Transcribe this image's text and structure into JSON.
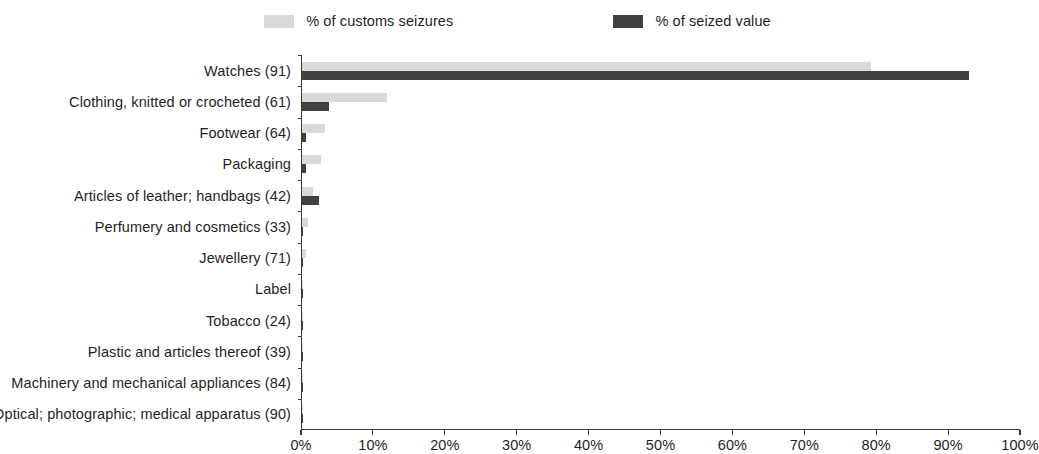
{
  "legend": {
    "entries": [
      {
        "label": "% of customs seizures",
        "color": "#d9d9d9",
        "swatch_name": "legend-swatch-customs-seizures"
      },
      {
        "label": "% of seized value",
        "color": "#414141",
        "swatch_name": "legend-swatch-seized-value"
      }
    ]
  },
  "chart_data": {
    "type": "bar",
    "orientation": "horizontal",
    "title": "",
    "subtitle": "",
    "xlabel": "",
    "ylabel": "",
    "xlim": [
      0,
      100
    ],
    "xtick_labels": [
      "0%",
      "10%",
      "20%",
      "30%",
      "40%",
      "50%",
      "60%",
      "70%",
      "80%",
      "90%",
      "100%"
    ],
    "xtick_values": [
      0,
      10,
      20,
      30,
      40,
      50,
      60,
      70,
      80,
      90,
      100
    ],
    "grid": false,
    "legend_position": "top-center",
    "categories": [
      "Watches (91)",
      "Clothing, knitted or crocheted (61)",
      "Footwear (64)",
      "Packaging",
      "Articles of leather; handbags (42)",
      "Perfumery and cosmetics (33)",
      "Jewellery (71)",
      "Label",
      "Tobacco (24)",
      "Plastic and articles thereof (39)",
      "Machinery and mechanical appliances (84)",
      "Optical; photographic; medical apparatus (90)"
    ],
    "series": [
      {
        "name": "% of customs seizures",
        "color": "#d9d9d9",
        "values": [
          79.2,
          11.8,
          3.2,
          2.6,
          1.5,
          0.9,
          0.6,
          0.2,
          0.2,
          0.2,
          0.1,
          0.1
        ]
      },
      {
        "name": "% of seized value",
        "color": "#414141",
        "values": [
          92.9,
          3.8,
          0.5,
          0.5,
          2.4,
          0.2,
          0.2,
          0.1,
          0.1,
          0.1,
          0.1,
          0.1
        ]
      }
    ]
  }
}
